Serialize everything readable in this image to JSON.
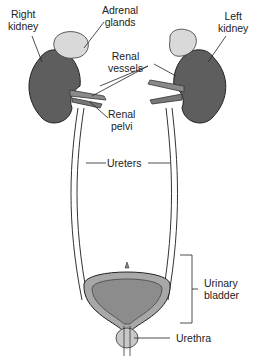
{
  "labels": {
    "right_kidney": [
      "Right",
      "kidney"
    ],
    "adrenal_glands": [
      "Adrenal",
      "glands"
    ],
    "left_kidney": [
      "Left",
      "kidney"
    ],
    "renal_vessels": [
      "Renal",
      "vessels"
    ],
    "renal_pelvi": [
      "Renal",
      "pelvi"
    ],
    "ureters": "Ureters",
    "urinary_bladder": [
      "Urinary",
      "bladder"
    ],
    "urethra": "Urethra"
  },
  "colors": {
    "kidney": "#5e5e5e",
    "adrenal": "#d9d9d9",
    "bladder_wall": "#a8a8a8",
    "bladder_inner": "#8c8c8c",
    "outline": "#222222"
  }
}
